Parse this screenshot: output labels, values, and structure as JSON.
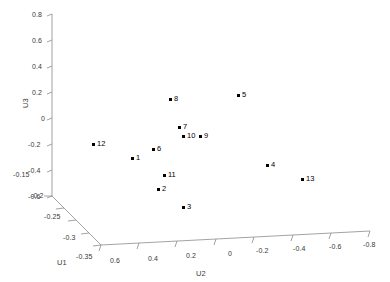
{
  "chart_data": {
    "type": "scatter",
    "title": "",
    "xlabel": "U2",
    "ylabel": "U1",
    "zlabel": "U3",
    "projection": "3d",
    "grid": false,
    "legend": null,
    "axes": {
      "u1": {
        "label": "U1",
        "ticks": [
          "-0.15",
          "-0.2",
          "-0.25",
          "-0.3",
          "-0.35"
        ],
        "range": [
          -0.15,
          -0.35
        ]
      },
      "u2": {
        "label": "U2",
        "ticks": [
          "0.6",
          "0.4",
          "0.2",
          "0",
          "-0.2",
          "-0.4",
          "-0.6",
          "-0.8"
        ],
        "range": [
          0.6,
          -0.8
        ]
      },
      "u3": {
        "label": "U3",
        "ticks": [
          "0.8",
          "0.6",
          "0.4",
          "0.2",
          "0",
          "-0.2",
          "-0.4",
          "-0.6"
        ],
        "range": [
          0.8,
          -0.6
        ]
      }
    },
    "points": [
      {
        "label": "1",
        "px": 133,
        "py": 159
      },
      {
        "label": "2",
        "px": 159,
        "py": 190
      },
      {
        "label": "3",
        "px": 184,
        "py": 208
      },
      {
        "label": "4",
        "px": 268,
        "py": 166
      },
      {
        "label": "5",
        "px": 239,
        "py": 96
      },
      {
        "label": "6",
        "px": 154,
        "py": 150
      },
      {
        "label": "7",
        "px": 180,
        "py": 128
      },
      {
        "label": "8",
        "px": 171,
        "py": 100
      },
      {
        "label": "9",
        "px": 201,
        "py": 137
      },
      {
        "label": "10",
        "px": 184,
        "py": 137
      },
      {
        "label": "11",
        "px": 165,
        "py": 176
      },
      {
        "label": "12",
        "px": 94,
        "py": 145
      },
      {
        "label": "13",
        "px": 303,
        "py": 180
      }
    ]
  },
  "ticks": {
    "u3": [
      {
        "text": "0.8",
        "x": 32,
        "y": 11
      },
      {
        "text": "0.6",
        "x": 32,
        "y": 37
      },
      {
        "text": "0.4",
        "x": 32,
        "y": 63
      },
      {
        "text": "0.2",
        "x": 32,
        "y": 89
      },
      {
        "text": "0",
        "x": 41,
        "y": 115
      },
      {
        "text": "-0.2",
        "x": 28,
        "y": 141
      },
      {
        "text": "-0.4",
        "x": 28,
        "y": 167
      },
      {
        "text": "-0.6",
        "x": 28,
        "y": 193
      }
    ],
    "u1": [
      {
        "text": "-0.15",
        "x": 13,
        "y": 171
      },
      {
        "text": "-0.2",
        "x": 31,
        "y": 192
      },
      {
        "text": "-0.25",
        "x": 44,
        "y": 213
      },
      {
        "text": "-0.3",
        "x": 63,
        "y": 234
      },
      {
        "text": "-0.35",
        "x": 76,
        "y": 253
      }
    ],
    "u2": [
      {
        "text": "0.6",
        "x": 110,
        "y": 257
      },
      {
        "text": "0.4",
        "x": 148,
        "y": 255
      },
      {
        "text": "0.2",
        "x": 186,
        "y": 252
      },
      {
        "text": "0",
        "x": 228,
        "y": 250
      },
      {
        "text": "-0.2",
        "x": 256,
        "y": 247
      },
      {
        "text": "-0.4",
        "x": 293,
        "y": 245
      },
      {
        "text": "-0.6",
        "x": 329,
        "y": 243
      },
      {
        "text": "-0.8",
        "x": 363,
        "y": 241
      }
    ]
  },
  "axis_titles": {
    "u3": {
      "text": "U3",
      "x": 21,
      "y": 108
    },
    "u1": {
      "text": "U1",
      "x": 57,
      "y": 258
    },
    "u2": {
      "text": "U2",
      "x": 196,
      "y": 269
    }
  },
  "colors": {
    "marker": "#000000",
    "axis_line": "#8c8c8c",
    "tick_text": "#3a3a3a",
    "background": "#ffffff"
  }
}
